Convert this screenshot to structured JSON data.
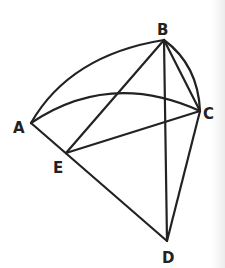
{
  "diagram": {
    "points": {
      "A": {
        "label": "A",
        "x": 31,
        "y": 123,
        "lx": 13,
        "ly": 133
      },
      "B": {
        "label": "B",
        "x": 164,
        "y": 40,
        "lx": 157,
        "ly": 35
      },
      "C": {
        "label": "C",
        "x": 200,
        "y": 111,
        "lx": 203,
        "ly": 119
      },
      "D": {
        "label": "D",
        "x": 167,
        "y": 241,
        "lx": 162,
        "ly": 263
      },
      "E": {
        "label": "E",
        "x": 66,
        "y": 153,
        "lx": 53,
        "ly": 173
      }
    },
    "segments": [
      "A-D",
      "B-E",
      "B-D",
      "B-C",
      "C-D",
      "E-C"
    ],
    "arcs": [
      "A-B",
      "A-C",
      "B-C"
    ],
    "stroke_color": "#222222"
  }
}
